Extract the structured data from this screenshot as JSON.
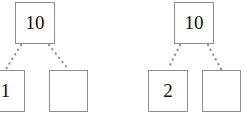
{
  "diagram": {
    "background_color": "#ffffff",
    "border_color": "#8d8d8d",
    "text_color": "#111111",
    "edge_style": "dotted",
    "trees": [
      {
        "name": "left-tree",
        "root": {
          "label": "10",
          "x": 15,
          "y": 2,
          "w": 40,
          "h": 42
        },
        "children": [
          {
            "label": "1",
            "x": -14,
            "y": 70,
            "w": 39,
            "h": 42
          },
          {
            "label": "",
            "x": 49,
            "y": 70,
            "w": 39,
            "h": 42
          }
        ]
      },
      {
        "name": "right-tree",
        "root": {
          "label": "10",
          "x": 174,
          "y": 2,
          "w": 40,
          "h": 42
        },
        "children": [
          {
            "label": "2",
            "x": 148,
            "y": 70,
            "w": 40,
            "h": 42
          },
          {
            "label": "",
            "x": 202,
            "y": 70,
            "w": 39,
            "h": 42
          }
        ]
      }
    ],
    "edges": [
      {
        "name": "left-tree-edge-left",
        "x1": 21,
        "y1": 45,
        "x2": 6,
        "y2": 69
      },
      {
        "name": "left-tree-edge-right",
        "x1": 49,
        "y1": 45,
        "x2": 68,
        "y2": 69
      },
      {
        "name": "right-tree-edge-left",
        "x1": 180,
        "y1": 45,
        "x2": 168,
        "y2": 69
      },
      {
        "name": "right-tree-edge-right",
        "x1": 208,
        "y1": 45,
        "x2": 221,
        "y2": 69
      }
    ]
  }
}
